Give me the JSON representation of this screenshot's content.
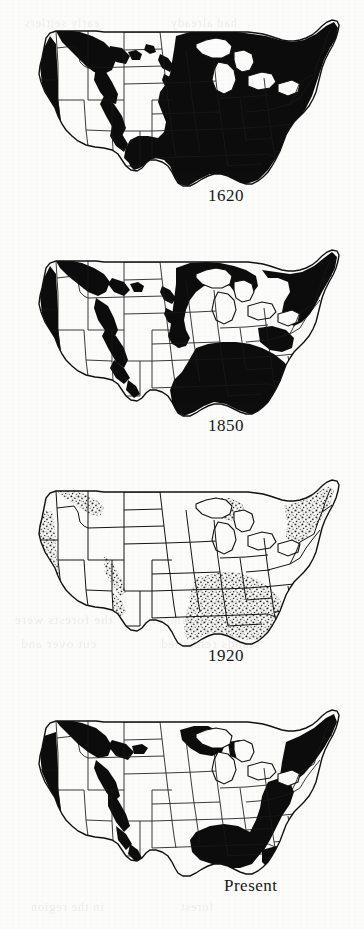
{
  "figure": {
    "kind": "map-series",
    "background_color": "#fcfcfa",
    "ink_color": "#111111",
    "panel_count": 4
  },
  "panels": [
    {
      "id": "panel-1620",
      "label": "1620",
      "label_x": 208,
      "label_y": 196,
      "fill_style": "solid",
      "coverage_note": "Nearly continuous forest east of the Great Plains; Pacific Northwest, northern Rockies and Sierra Nevada forested",
      "coverage_percent_east": 95,
      "coverage_percent_west": 35
    },
    {
      "id": "panel-1850",
      "label": "1850",
      "label_x": 208,
      "label_y": 426,
      "fill_style": "solid",
      "coverage_note": "Eastern forest still extensive but cleared across Ohio Valley, lower Great Lakes and the mid-Atlantic piedmont",
      "coverage_percent_east": 72,
      "coverage_percent_west": 33
    },
    {
      "id": "panel-1920",
      "label": "1920",
      "label_x": 208,
      "label_y": 656,
      "fill_style": "stipple",
      "coverage_note": "Virgin forest reduced to scattered stipple remnants; heaviest losses in the Northeast, Lake States and Midwest",
      "coverage_percent_east": 18,
      "coverage_percent_west": 12
    },
    {
      "id": "panel-present",
      "label": "Present",
      "label_x": 224,
      "label_y": 886,
      "fill_style": "solid",
      "coverage_note": "Second-growth forest recovered across Appalachians, South, Lake States and Pacific Northwest",
      "coverage_percent_east": 55,
      "coverage_percent_west": 30
    }
  ],
  "ghost_text": [
    {
      "text": "the forests were",
      "x": 14,
      "y": 612,
      "size": 13
    },
    {
      "text": "of timber",
      "x": 150,
      "y": 612,
      "size": 13
    },
    {
      "text": "cut over and",
      "x": 20,
      "y": 636,
      "size": 13
    },
    {
      "text": "stands remained",
      "x": 160,
      "y": 636,
      "size": 13
    },
    {
      "text": "in the region",
      "x": 30,
      "y": 900,
      "size": 12
    },
    {
      "text": "forest",
      "x": 180,
      "y": 900,
      "size": 12
    },
    {
      "text": "early settlers",
      "x": 24,
      "y": 16,
      "size": 12
    },
    {
      "text": "had already",
      "x": 170,
      "y": 16,
      "size": 12
    }
  ]
}
